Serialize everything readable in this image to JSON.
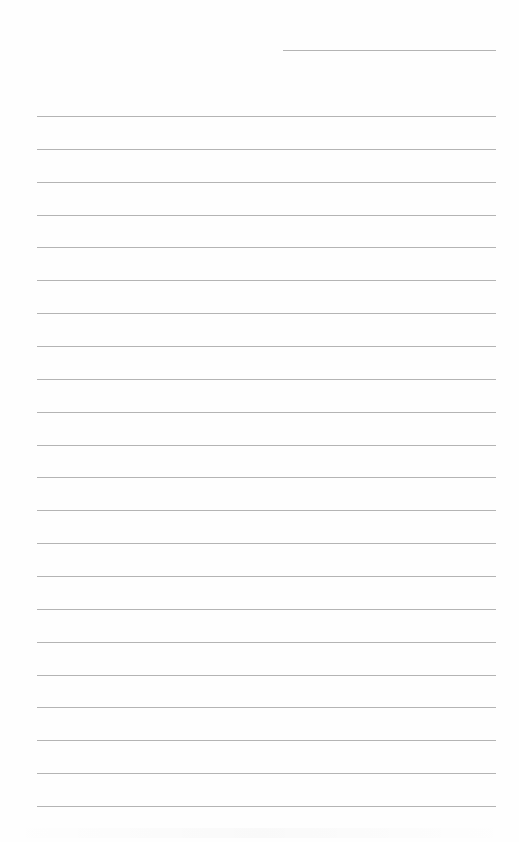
{
  "page": {
    "type": "lined-writing-sheet",
    "background_color": "#fefefe",
    "line_color": "#b4b4b4",
    "header_line": {
      "top": 50,
      "left": 283,
      "right": 496
    },
    "body_lines": {
      "count": 22,
      "first_top": 116,
      "spacing": 32.857,
      "left": 37,
      "right": 496
    },
    "text": []
  }
}
